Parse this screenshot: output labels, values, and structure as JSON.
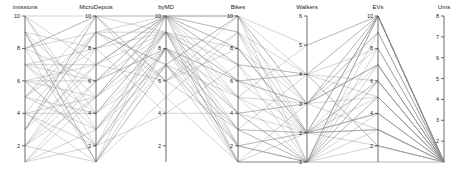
{
  "chart_data": {
    "type": "parallel-coordinates",
    "title": "",
    "line_color": "#8e8e8e",
    "axes": [
      {
        "name": "ímissions",
        "x": 25,
        "range": [
          1,
          10
        ],
        "ticks": [
          2,
          4,
          6,
          8,
          10
        ]
      },
      {
        "name": "MicroDepots",
        "x": 96,
        "range": [
          1,
          10
        ],
        "ticks": [
          2,
          4,
          6,
          8,
          10
        ]
      },
      {
        "name": "byMD",
        "x": 166,
        "range": [
          1,
          10
        ],
        "ticks": [
          2,
          4,
          6,
          8,
          10
        ]
      },
      {
        "name": "Bikes",
        "x": 238,
        "range": [
          1,
          10
        ],
        "ticks": [
          2,
          4,
          6,
          8,
          10
        ]
      },
      {
        "name": "Walkers",
        "x": 307,
        "range": [
          1,
          6
        ],
        "ticks": [
          1,
          2,
          3,
          4,
          5,
          6
        ]
      },
      {
        "name": "EVs",
        "x": 378,
        "range": [
          1,
          10
        ],
        "ticks": [
          2,
          4,
          6,
          8,
          10
        ]
      },
      {
        "name": "Ums",
        "x": 444,
        "range": [
          1,
          8
        ],
        "ticks": [
          2,
          3,
          4,
          5,
          6,
          7,
          8
        ]
      }
    ],
    "rows": [
      [
        10,
        10,
        10,
        10,
        5,
        10,
        1
      ],
      [
        9,
        8,
        10,
        6,
        4,
        10,
        1
      ],
      [
        8,
        6,
        9,
        4,
        3,
        7,
        1
      ],
      [
        7,
        4,
        8,
        2,
        2,
        6,
        1
      ],
      [
        6,
        2,
        7,
        1,
        1,
        5,
        1
      ],
      [
        5,
        10,
        6,
        8,
        2,
        4,
        1
      ],
      [
        4,
        9,
        10,
        10,
        3,
        3,
        1
      ],
      [
        3,
        7,
        9,
        7,
        4,
        2,
        1
      ],
      [
        2,
        5,
        8,
        5,
        1,
        1,
        1
      ],
      [
        1,
        3,
        7,
        3,
        2,
        10,
        1
      ],
      [
        9,
        1,
        10,
        1,
        1,
        8,
        1
      ],
      [
        8,
        10,
        5,
        9,
        3,
        7,
        1
      ],
      [
        7,
        8,
        4,
        7,
        4,
        5,
        1
      ],
      [
        6,
        6,
        10,
        5,
        2,
        4,
        1
      ],
      [
        5,
        4,
        9,
        3,
        1,
        10,
        1
      ],
      [
        4,
        2,
        8,
        1,
        3,
        9,
        1
      ],
      [
        3,
        9,
        7,
        10,
        1,
        6,
        1
      ],
      [
        2,
        7,
        10,
        8,
        2,
        3,
        1
      ],
      [
        1,
        5,
        9,
        6,
        4,
        2,
        1
      ],
      [
        10,
        3,
        8,
        4,
        3,
        10,
        1
      ],
      [
        9,
        1,
        7,
        2,
        1,
        7,
        1
      ],
      [
        8,
        9,
        6,
        9,
        2,
        5,
        1
      ],
      [
        7,
        7,
        10,
        7,
        1,
        1,
        1
      ],
      [
        6,
        5,
        9,
        5,
        3,
        10,
        1
      ],
      [
        5,
        3,
        8,
        3,
        4,
        6,
        1
      ],
      [
        4,
        1,
        5,
        1,
        2,
        3,
        1
      ],
      [
        3,
        10,
        10,
        9,
        1,
        10,
        1
      ],
      [
        2,
        8,
        9,
        6,
        3,
        8,
        1
      ],
      [
        1,
        6,
        8,
        4,
        2,
        4,
        1
      ],
      [
        10,
        4,
        7,
        2,
        1,
        2,
        1
      ],
      [
        9,
        2,
        10,
        10,
        4,
        10,
        1
      ],
      [
        8,
        10,
        9,
        8,
        2,
        7,
        1
      ],
      [
        7,
        6,
        8,
        6,
        3,
        5,
        1
      ],
      [
        6,
        2,
        4,
        4,
        1,
        3,
        1
      ],
      [
        5,
        8,
        10,
        2,
        2,
        10,
        1
      ],
      [
        4,
        4,
        9,
        1,
        1,
        6,
        1
      ],
      [
        3,
        10,
        6,
        10,
        3,
        9,
        1
      ],
      [
        2,
        6,
        10,
        7,
        2,
        10,
        1
      ],
      [
        1,
        2,
        8,
        3,
        1,
        5,
        1
      ],
      [
        5,
        9,
        7,
        5,
        5,
        10,
        1
      ],
      [
        6,
        7,
        10,
        9,
        4,
        8,
        1
      ],
      [
        7,
        3,
        9,
        1,
        1,
        4,
        1
      ],
      [
        8,
        1,
        8,
        6,
        2,
        2,
        1
      ],
      [
        4,
        5,
        10,
        8,
        3,
        7,
        1
      ],
      [
        3,
        9,
        9,
        2,
        1,
        10,
        1
      ],
      [
        2,
        1,
        7,
        10,
        2,
        6,
        1
      ],
      [
        9,
        5,
        10,
        4,
        1,
        9,
        1
      ],
      [
        10,
        7,
        6,
        3,
        2,
        3,
        1
      ]
    ],
    "y_pixel_range": [
      162,
      16
    ]
  }
}
